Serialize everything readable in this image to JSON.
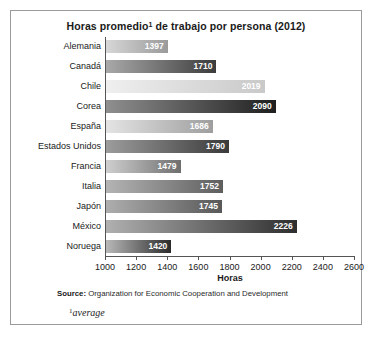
{
  "figure": {
    "title_main": "Horas promedio",
    "title_sup": "1",
    "title_rest": " de trabajo por persona (2012)",
    "x_axis_title": "Horas",
    "source_label": "Source:",
    "source_text": " Organization for Economic Cooperation and Development",
    "footnote_sup": "1",
    "footnote_text": "average",
    "border_color": "#9a9a9a",
    "axis_color": "#555555"
  },
  "chart_data": {
    "type": "bar",
    "orientation": "horizontal",
    "xlabel": "Horas",
    "ylabel": "",
    "xlim": [
      1000,
      2600
    ],
    "xticks": [
      1000,
      1200,
      1400,
      1600,
      1800,
      2000,
      2200,
      2400,
      2600
    ],
    "grid": false,
    "legend": false,
    "categories": [
      "Alemania",
      "Canadá",
      "Chile",
      "Corea",
      "España",
      "Estados Unidos",
      "Francia",
      "Italia",
      "Japón",
      "México",
      "Noruega"
    ],
    "values": [
      1397,
      1710,
      2019,
      2090,
      1686,
      1790,
      1479,
      1752,
      1745,
      2226,
      1420
    ],
    "bars": [
      {
        "label": "Alemania",
        "value": 1397,
        "value_text": "1397",
        "color_from": "#d7d7d7",
        "color_to": "#9a9a9a"
      },
      {
        "label": "Canadá",
        "value": 1710,
        "value_text": "1710",
        "color_from": "#a9a9a9",
        "color_to": "#3c3c3c"
      },
      {
        "label": "Chile",
        "value": 2019,
        "value_text": "2019",
        "color_from": "#efefef",
        "color_to": "#c9c9c9"
      },
      {
        "label": "Corea",
        "value": 2090,
        "value_text": "2090",
        "color_from": "#8f8f8f",
        "color_to": "#1f1f1f"
      },
      {
        "label": "España",
        "value": 1686,
        "value_text": "1686",
        "color_from": "#e4e4e4",
        "color_to": "#9e9e9e"
      },
      {
        "label": "Estados Unidos",
        "value": 1790,
        "value_text": "1790",
        "color_from": "#9c9c9c",
        "color_to": "#3a3a3a"
      },
      {
        "label": "Francia",
        "value": 1479,
        "value_text": "1479",
        "color_from": "#cfcfcf",
        "color_to": "#6e6e6e"
      },
      {
        "label": "Italia",
        "value": 1752,
        "value_text": "1752",
        "color_from": "#b4b4b4",
        "color_to": "#5e5e5e"
      },
      {
        "label": "Japón",
        "value": 1745,
        "value_text": "1745",
        "color_from": "#aeaeae",
        "color_to": "#585858"
      },
      {
        "label": "México",
        "value": 2226,
        "value_text": "2226",
        "color_from": "#b0b0b0",
        "color_to": "#2e2e2e"
      },
      {
        "label": "Noruega",
        "value": 1420,
        "value_text": "1420",
        "color_from": "#b8b8b8",
        "color_to": "#2b2b2b"
      }
    ]
  }
}
